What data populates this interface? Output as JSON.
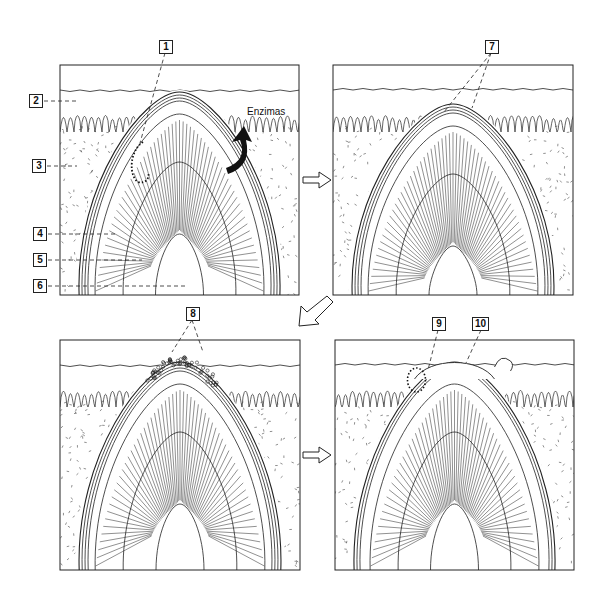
{
  "figure": {
    "colors": {
      "line": "#222222",
      "background": "#ffffff",
      "arrow_fill": "#111111"
    },
    "panels": [
      {
        "id": "panel-1",
        "x": 60,
        "y": 65,
        "w": 239,
        "h": 230,
        "stage": "enzymes act on sheath",
        "tip_y": 92,
        "erupted": false,
        "debris": false
      },
      {
        "id": "panel-2",
        "x": 333,
        "y": 65,
        "w": 240,
        "h": 230,
        "stage": "outer layers thin at apex",
        "tip_y": 104,
        "erupted": false,
        "debris": false
      },
      {
        "id": "panel-3",
        "x": 60,
        "y": 340,
        "w": 240,
        "h": 230,
        "stage": "surface layers breaking",
        "tip_y": 362,
        "erupted": false,
        "debris": true
      },
      {
        "id": "panel-4",
        "x": 335,
        "y": 340,
        "w": 239,
        "h": 230,
        "stage": "structure erupted",
        "tip_y": 362,
        "erupted": true,
        "debris": false
      }
    ],
    "callouts": [
      {
        "label": "1",
        "x": 159,
        "y": 40,
        "target_x": 140,
        "target_y": 143
      },
      {
        "label": "2",
        "x": 29,
        "y": 94,
        "target_x": 77,
        "target_y": 100
      },
      {
        "label": "3",
        "x": 32,
        "y": 159,
        "target_x": 77,
        "target_y": 165
      },
      {
        "label": "4",
        "x": 33,
        "y": 227,
        "target_x": 117,
        "target_y": 233
      },
      {
        "label": "5",
        "x": 33,
        "y": 253,
        "target_x": 142,
        "target_y": 259
      },
      {
        "label": "6",
        "x": 33,
        "y": 279,
        "target_x": 185,
        "target_y": 284
      },
      {
        "label": "7",
        "x": 485,
        "y": 40,
        "target_x": 444,
        "target_y": 112
      },
      {
        "label": "8",
        "x": 186,
        "y": 307,
        "target_x": 172,
        "target_y": 352
      },
      {
        "label": "9",
        "x": 432,
        "y": 317,
        "target_x": 428,
        "target_y": 370
      },
      {
        "label": "10",
        "x": 472,
        "y": 317,
        "target_x": 466,
        "target_y": 363
      }
    ],
    "callout_7_second_target": {
      "x": 472,
      "y": 108
    },
    "callout_8_second_target": {
      "x": 203,
      "y": 352
    },
    "annotation": {
      "text": "Enzimas",
      "x": 247,
      "y": 118
    },
    "flow_arrows": [
      {
        "id": "arrow-1-to-2",
        "direction": "right",
        "x": 303,
        "y": 180
      },
      {
        "id": "arrow-2-to-3",
        "direction": "down-left",
        "x": 305,
        "y": 290
      },
      {
        "id": "arrow-3-to-4",
        "direction": "right",
        "x": 303,
        "y": 455
      }
    ]
  }
}
